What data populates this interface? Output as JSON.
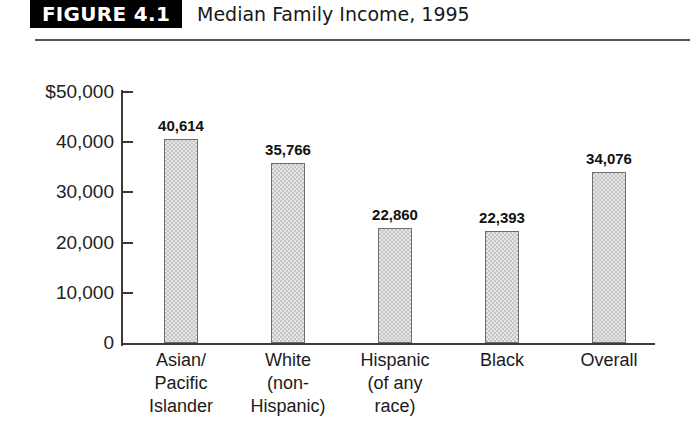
{
  "header": {
    "figure_tag": "FIGURE 4.1",
    "title": "Median Family Income, 1995"
  },
  "chart_data": {
    "type": "bar",
    "title": "Median Family Income, 1995",
    "xlabel": "",
    "ylabel": "",
    "ylim": [
      0,
      50000
    ],
    "yticks": [
      0,
      10000,
      20000,
      30000,
      40000,
      50000
    ],
    "ytick_labels": [
      "0",
      "10,000",
      "20,000",
      "30,000",
      "40,000",
      "$50,000"
    ],
    "grid": false,
    "legend": false,
    "categories": [
      "Asian/ Pacific Islander",
      "White (non-Hispanic)",
      "Hispanic (of any race)",
      "Black",
      "Overall"
    ],
    "category_lines": [
      [
        "Asian/",
        "Pacific",
        "Islander"
      ],
      [
        "White",
        "(non-",
        "Hispanic)"
      ],
      [
        "Hispanic",
        "(of any",
        "race)"
      ],
      [
        "Black"
      ],
      [
        "Overall"
      ]
    ],
    "values": [
      40614,
      35766,
      22860,
      22393,
      34076
    ],
    "value_labels": [
      "40,614",
      "35,766",
      "22,860",
      "22,393",
      "34,076"
    ],
    "bar_color": "#c6c6c6",
    "bar_edge_color": "#6e6e6e"
  }
}
